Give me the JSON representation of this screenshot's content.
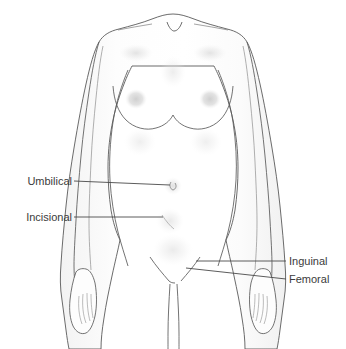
{
  "figure": {
    "background_color": "#ffffff",
    "outline_color": "#555555",
    "skin_fill_color": "#fcfcfc",
    "shading_color": "#e2e2e2",
    "leader_line_color": "#4a4a4a",
    "label_color": "#3b3b3b"
  },
  "labels": [
    {
      "id": "umbilical",
      "text": "Umbilical",
      "side": "left",
      "target": "navel"
    },
    {
      "id": "incisional",
      "text": "Incisional",
      "side": "left",
      "target": "lower abdomen"
    },
    {
      "id": "inguinal",
      "text": "Inguinal",
      "side": "right",
      "target": "groin crease"
    },
    {
      "id": "femoral",
      "text": "Femoral",
      "side": "right",
      "target": "upper inner thigh"
    }
  ]
}
